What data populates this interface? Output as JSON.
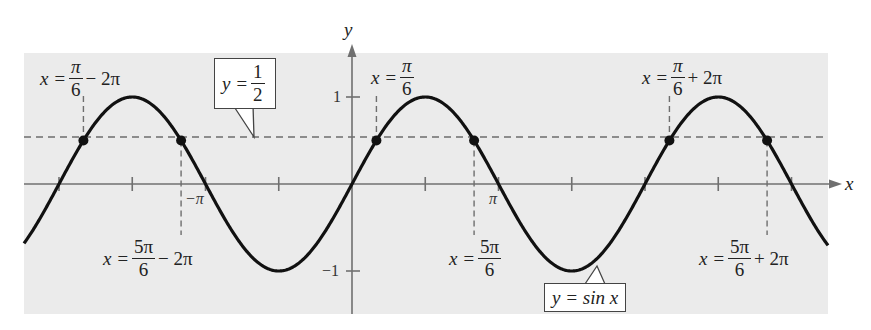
{
  "figure": {
    "function_label": "y = sin x",
    "horizontal_line_label": {
      "lhs": "y =",
      "num": "1",
      "den": "2"
    },
    "axes": {
      "x_label": "x",
      "y_label": "y",
      "y_ticks": [
        {
          "value": 1,
          "label": "1"
        },
        {
          "value": -1,
          "label": "−1"
        }
      ],
      "x_tick_labels": [
        {
          "value": "-pi",
          "label": "−π"
        },
        {
          "value": "pi",
          "label": "π"
        }
      ],
      "x_tick_step": "π/2"
    },
    "solution_labels": [
      {
        "id": "pi6-minus-2pi",
        "lhs": "x =",
        "num": "π",
        "den": "6",
        "tail": "− 2π"
      },
      {
        "id": "pi6",
        "lhs": "x =",
        "num": "π",
        "den": "6",
        "tail": ""
      },
      {
        "id": "pi6-plus-2pi",
        "lhs": "x =",
        "num": "π",
        "den": "6",
        "tail": "+ 2π"
      },
      {
        "id": "5pi6-minus-2pi",
        "lhs": "x =",
        "num": "5π",
        "den": "6",
        "tail": "− 2π"
      },
      {
        "id": "5pi6",
        "lhs": "x =",
        "num": "5π",
        "den": "6",
        "tail": ""
      },
      {
        "id": "5pi6-plus-2pi",
        "lhs": "x =",
        "num": "5π",
        "den": "6",
        "tail": "+ 2π"
      }
    ],
    "intersection_points_x_over_pi": [
      -1.8333,
      -1.1667,
      0.1667,
      0.8333,
      2.1667,
      2.8333
    ],
    "colors": {
      "panel_background": "#ebebeb",
      "curve": "#111111",
      "axis": "#707070",
      "dashed": "#6e6e6e",
      "text": "#222222"
    }
  }
}
